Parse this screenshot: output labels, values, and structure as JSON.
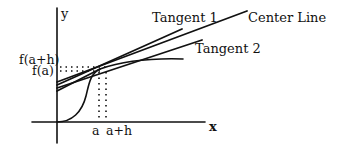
{
  "diagram": {
    "type": "tangent-lines-illustration",
    "axes": {
      "x_label": "x",
      "y_label": "y"
    },
    "y_tick_labels": [
      "f(a+h)",
      "f(a)"
    ],
    "x_tick_labels": [
      "a",
      "a+h"
    ],
    "line_labels": {
      "tangent1": "Tangent 1",
      "center": "Center Line",
      "tangent2": "Tangent 2"
    },
    "colors": {
      "ink": "#111111",
      "background": "#ffffff"
    }
  }
}
